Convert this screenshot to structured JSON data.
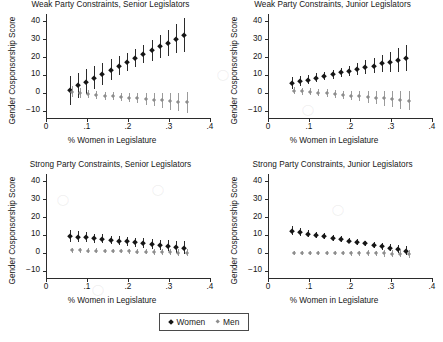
{
  "figure": {
    "width": 443,
    "height": 342,
    "background": "#ffffff",
    "women_color": "#161616",
    "men_color": "#8d8d8d"
  },
  "legend": {
    "entries": [
      {
        "label": "Women",
        "marker": "filled-diamond-dark",
        "color": "#161616"
      },
      {
        "label": "Men",
        "marker": "filled-diamond-gray",
        "color": "#8d8d8d"
      }
    ]
  },
  "axes": {
    "xlabel": "% Women in Legislature",
    "ylabel": "Gender Cosponsorship Score",
    "xticks": [
      "0",
      ".1",
      ".2",
      ".3",
      ".4"
    ],
    "xtick_values": [
      0,
      0.1,
      0.2,
      0.3,
      0.4
    ],
    "yticks": [
      "40",
      "30",
      "20",
      "10",
      "0",
      "−10"
    ],
    "ytick_values": [
      40,
      30,
      20,
      10,
      0,
      -10
    ],
    "xlim": [
      0,
      0.4
    ],
    "ylim": [
      -14,
      44
    ],
    "grid": false
  },
  "chart_data": [
    {
      "type": "scatter",
      "panel": 0,
      "title": "Weak Party Constraints, Senior Legislators",
      "xlabel": "% Women in Legislature",
      "ylabel": "Gender Cosponsorship Score",
      "xlim": [
        0,
        0.4
      ],
      "ylim": [
        -14,
        44
      ],
      "grid": false,
      "x": [
        0.06,
        0.08,
        0.1,
        0.12,
        0.14,
        0.16,
        0.18,
        0.2,
        0.22,
        0.24,
        0.26,
        0.28,
        0.3,
        0.32,
        0.34
      ],
      "series": [
        {
          "name": "Women",
          "color": "#161616",
          "values": [
            1.4,
            4.2,
            6.3,
            8.5,
            10.6,
            12.8,
            15.0,
            17.2,
            19.4,
            21.6,
            23.8,
            25.9,
            28.0,
            30.2,
            32.2
          ],
          "ci_low": [
            -6.5,
            -3.0,
            -0.5,
            2.0,
            4.5,
            7.0,
            9.8,
            12.2,
            14.5,
            16.4,
            18.0,
            19.4,
            20.8,
            22.0,
            22.9
          ],
          "ci_high": [
            9.3,
            11.3,
            13.2,
            15.0,
            16.8,
            18.7,
            20.5,
            22.4,
            24.5,
            26.8,
            29.4,
            32.3,
            35.3,
            38.4,
            41.6
          ]
        },
        {
          "name": "Men",
          "color": "#8d8d8d",
          "values": [
            0.6,
            0.0,
            -0.6,
            -1.2,
            -1.5,
            -1.9,
            -2.3,
            -2.7,
            -3.1,
            -3.5,
            -3.8,
            -4.2,
            -4.6,
            -5.0,
            -5.3
          ],
          "ci_low": [
            -2.4,
            -2.6,
            -3.0,
            -3.4,
            -3.7,
            -4.1,
            -4.6,
            -5.2,
            -5.9,
            -6.7,
            -7.5,
            -8.4,
            -9.3,
            -10.2,
            -11.2
          ],
          "ci_high": [
            3.6,
            2.6,
            1.8,
            1.0,
            0.7,
            0.3,
            0.0,
            -0.2,
            -0.3,
            -0.3,
            -0.1,
            0.0,
            0.1,
            0.2,
            0.6
          ]
        }
      ]
    },
    {
      "type": "scatter",
      "panel": 1,
      "title": "Weak Party Constraints, Junior Legislators",
      "xlabel": "% Women in Legislature",
      "ylabel": "Gender Cosponsorship Score",
      "xlim": [
        0,
        0.4
      ],
      "ylim": [
        -14,
        44
      ],
      "grid": false,
      "x": [
        0.06,
        0.08,
        0.1,
        0.12,
        0.14,
        0.16,
        0.18,
        0.2,
        0.22,
        0.24,
        0.26,
        0.28,
        0.3,
        0.32,
        0.34
      ],
      "series": [
        {
          "name": "Women",
          "color": "#161616",
          "values": [
            5.4,
            6.6,
            7.4,
            8.4,
            9.4,
            10.4,
            11.5,
            12.4,
            13.4,
            14.4,
            15.2,
            16.4,
            17.3,
            18.4,
            19.4
          ],
          "ci_low": [
            2.0,
            3.6,
            4.8,
            5.9,
            7.0,
            8.0,
            8.9,
            9.6,
            10.2,
            10.7,
            11.0,
            11.4,
            11.6,
            11.8,
            12.0
          ],
          "ci_high": [
            8.8,
            9.6,
            10.1,
            10.9,
            11.8,
            12.8,
            14.1,
            15.2,
            16.6,
            18.1,
            19.4,
            21.4,
            23.0,
            25.0,
            26.8
          ]
        },
        {
          "name": "Men",
          "color": "#8d8d8d",
          "values": [
            1.2,
            0.9,
            0.6,
            0.2,
            -0.1,
            -0.5,
            -1.1,
            -1.5,
            -1.9,
            -2.3,
            -2.7,
            -3.1,
            -3.4,
            -3.8,
            -4.3
          ],
          "ci_low": [
            -0.8,
            -1.0,
            -1.3,
            -1.8,
            -2.2,
            -2.7,
            -3.4,
            -4.0,
            -4.8,
            -5.5,
            -6.3,
            -7.1,
            -7.9,
            -8.8,
            -9.8
          ],
          "ci_high": [
            3.2,
            2.8,
            2.5,
            2.2,
            2.0,
            1.7,
            1.2,
            1.0,
            1.0,
            0.9,
            0.9,
            0.9,
            1.1,
            1.2,
            1.2
          ]
        }
      ]
    },
    {
      "type": "scatter",
      "panel": 2,
      "title": "Strong Party Constraints, Senior Legislators",
      "xlabel": "% Women in Legislature",
      "ylabel": "Gender Cosponsorship Score",
      "xlim": [
        0,
        0.4
      ],
      "ylim": [
        -14,
        44
      ],
      "grid": false,
      "x": [
        0.06,
        0.08,
        0.1,
        0.12,
        0.14,
        0.16,
        0.18,
        0.2,
        0.22,
        0.24,
        0.26,
        0.28,
        0.3,
        0.32,
        0.34
      ],
      "series": [
        {
          "name": "Women",
          "color": "#161616",
          "values": [
            9.3,
            9.0,
            8.6,
            8.2,
            7.8,
            7.3,
            6.9,
            6.4,
            5.9,
            5.5,
            5.0,
            4.5,
            4.0,
            3.5,
            3.0
          ],
          "ci_low": [
            5.8,
            5.9,
            5.8,
            5.6,
            5.3,
            4.9,
            4.5,
            4.0,
            3.5,
            2.9,
            2.3,
            1.6,
            0.9,
            0.2,
            -0.5
          ],
          "ci_high": [
            12.8,
            12.1,
            11.4,
            10.8,
            10.3,
            9.7,
            9.3,
            8.8,
            8.3,
            8.1,
            7.7,
            7.4,
            7.1,
            6.8,
            6.5
          ]
        },
        {
          "name": "Men",
          "color": "#8d8d8d",
          "values": [
            1.5,
            1.4,
            1.3,
            1.2,
            1.1,
            1.0,
            0.9,
            0.8,
            0.7,
            0.6,
            0.5,
            0.4,
            0.3,
            0.2,
            0.1
          ],
          "ci_low": [
            0.0,
            0.0,
            0.0,
            -0.1,
            -0.1,
            -0.2,
            -0.3,
            -0.4,
            -0.5,
            -0.7,
            -0.9,
            -1.1,
            -1.3,
            -1.6,
            -1.9
          ],
          "ci_high": [
            3.0,
            2.8,
            2.6,
            2.5,
            2.3,
            2.2,
            2.1,
            2.0,
            1.9,
            1.9,
            1.9,
            1.9,
            1.9,
            2.0,
            2.1
          ]
        }
      ]
    },
    {
      "type": "scatter",
      "panel": 3,
      "title": "Strong Party Constraints, Junior Legislators",
      "xlabel": "% Women in Legislature",
      "ylabel": "Gender Cosponsorship Score",
      "xlim": [
        0,
        0.4
      ],
      "ylim": [
        -14,
        44
      ],
      "grid": false,
      "x": [
        0.06,
        0.08,
        0.1,
        0.12,
        0.14,
        0.16,
        0.18,
        0.2,
        0.22,
        0.24,
        0.26,
        0.28,
        0.3,
        0.32,
        0.34
      ],
      "series": [
        {
          "name": "Women",
          "color": "#161616",
          "values": [
            12.4,
            11.7,
            10.8,
            10.0,
            9.3,
            8.5,
            7.7,
            6.9,
            6.1,
            5.3,
            4.5,
            3.7,
            2.9,
            2.1,
            1.3
          ],
          "ci_low": [
            9.8,
            9.4,
            8.8,
            8.2,
            7.6,
            6.9,
            6.2,
            5.4,
            4.6,
            3.7,
            2.8,
            1.8,
            0.8,
            -0.3,
            -1.4
          ],
          "ci_high": [
            15.0,
            14.0,
            12.8,
            11.8,
            11.0,
            10.1,
            9.2,
            8.4,
            7.6,
            6.9,
            6.2,
            5.6,
            5.0,
            4.5,
            4.0
          ]
        },
        {
          "name": "Men",
          "color": "#8d8d8d",
          "values": [
            0.0,
            0.0,
            0.0,
            0.0,
            -0.1,
            -0.1,
            -0.1,
            -0.2,
            -0.2,
            -0.2,
            -0.3,
            -0.3,
            -0.4,
            -0.4,
            -0.5
          ],
          "ci_low": [
            -1.2,
            -1.2,
            -1.2,
            -1.2,
            -1.3,
            -1.3,
            -1.4,
            -1.5,
            -1.6,
            -1.8,
            -1.9,
            -2.1,
            -2.3,
            -2.5,
            -2.7
          ],
          "ci_high": [
            1.2,
            1.2,
            1.2,
            1.2,
            1.1,
            1.1,
            1.2,
            1.1,
            1.2,
            1.4,
            1.3,
            1.5,
            1.5,
            1.7,
            1.7
          ]
        }
      ]
    }
  ]
}
